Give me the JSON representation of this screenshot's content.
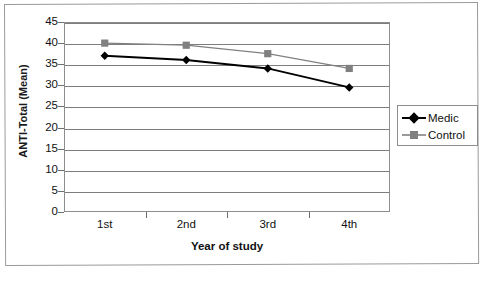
{
  "chart_data": {
    "type": "line",
    "title": "",
    "xlabel": "Year of study",
    "ylabel": "ANTI-Total (Mean)",
    "categories": [
      "1st",
      "2nd",
      "3rd",
      "4th"
    ],
    "ylim": [
      0,
      45
    ],
    "ytick_step": 5,
    "yticks": [
      45,
      40,
      35,
      30,
      25,
      20,
      15,
      10,
      5,
      0
    ],
    "grid": "horizontal",
    "legend_position": "right",
    "series": [
      {
        "name": "Medic",
        "color": "#000000",
        "marker": "diamond",
        "values": [
          37,
          36,
          34,
          29.5
        ]
      },
      {
        "name": "Control",
        "color": "#808080",
        "marker": "square",
        "values": [
          40,
          39.5,
          37.5,
          34
        ]
      }
    ]
  },
  "axis": {
    "y_title": "ANTI-Total (Mean)",
    "x_title": "Year of study",
    "y_tick_labels": [
      "45",
      "40",
      "35",
      "30",
      "25",
      "20",
      "15",
      "10",
      "5",
      "0"
    ],
    "x_tick_labels": [
      "1st",
      "2nd",
      "3rd",
      "4th"
    ]
  },
  "legend": {
    "entries": [
      {
        "label": "Medic",
        "color": "#000000",
        "marker": "diamond"
      },
      {
        "label": "Control",
        "color": "#808080",
        "marker": "square"
      }
    ]
  },
  "caption": {
    "fragment": ""
  }
}
